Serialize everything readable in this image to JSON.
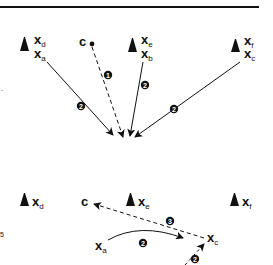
{
  "diagram": {
    "top_panel": {
      "rule_color": "#111111",
      "markers": [
        {
          "id": "marker-ad",
          "labels": [
            {
              "base": "x",
              "sub": "d"
            },
            {
              "base": "x",
              "sub": "a"
            }
          ]
        },
        {
          "id": "cursor-c",
          "labels": [
            {
              "base": "c",
              "sub": ""
            }
          ]
        },
        {
          "id": "marker-eb",
          "labels": [
            {
              "base": "x",
              "sub": "e"
            },
            {
              "base": "x",
              "sub": "b"
            }
          ]
        },
        {
          "id": "marker-fc",
          "labels": [
            {
              "base": "x",
              "sub": "f"
            },
            {
              "base": "x",
              "sub": "c"
            }
          ]
        }
      ],
      "arrows": [
        {
          "from": "x_a",
          "style": "solid",
          "step": "2"
        },
        {
          "from": "c",
          "style": "dashed",
          "step": "1"
        },
        {
          "from": "x_b",
          "style": "solid",
          "step": "2"
        },
        {
          "from": "x_c",
          "style": "solid",
          "step": "2"
        }
      ]
    },
    "bottom_panel": {
      "labels": {
        "xd": {
          "base": "x",
          "sub": "d"
        },
        "c": {
          "base": "c"
        },
        "xe": {
          "base": "x",
          "sub": "e"
        },
        "xf": {
          "base": "x",
          "sub": "f"
        },
        "xa": {
          "base": "x",
          "sub": "a"
        },
        "xc": {
          "base": "x",
          "sub": "c"
        }
      },
      "arrows": [
        {
          "from": "x_c",
          "to": "c",
          "style": "dashed",
          "step": "3"
        },
        {
          "from": "x_a",
          "to": "x_c",
          "style": "solid-curved",
          "step": "2"
        },
        {
          "from": "below",
          "to": "x_c",
          "style": "dashed",
          "step": "2"
        }
      ]
    },
    "badges": {
      "one": "1",
      "two": "2",
      "three": "3"
    },
    "side_fragments": {
      "left_upper": "·",
      "left_lower": "5"
    }
  }
}
